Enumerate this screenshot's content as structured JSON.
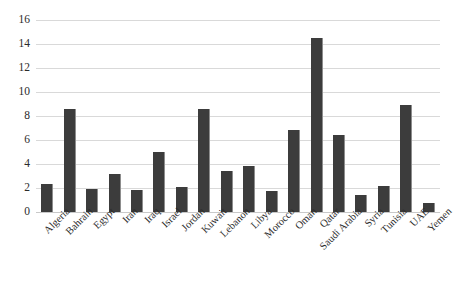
{
  "chart_data": {
    "type": "bar",
    "title": "",
    "xlabel": "",
    "ylabel": "",
    "ylim": [
      0,
      16
    ],
    "ytick_step": 2,
    "yticks": [
      16,
      14,
      12,
      10,
      8,
      6,
      4,
      2,
      0
    ],
    "grid": true,
    "legend": "none",
    "bar_color": "#3c3c3c",
    "gridline_color": "#d9d9d9",
    "background_color": "#ffffff",
    "categories": [
      "Algeria",
      "Bahrain",
      "Egypt",
      "Iran",
      "Iraq",
      "Israel",
      "Jordan",
      "Kuwait",
      "Lebanon",
      "Libya",
      "Morocco",
      "Oman",
      "Qatar",
      "Saudi Arabia",
      "Syria",
      "Tunisia",
      "UAE",
      "Yemen"
    ],
    "values": [
      2.3,
      8.6,
      1.9,
      3.2,
      1.85,
      5.0,
      2.1,
      8.6,
      3.4,
      3.8,
      1.75,
      6.8,
      14.5,
      6.4,
      1.4,
      2.2,
      8.9,
      0.75
    ]
  }
}
